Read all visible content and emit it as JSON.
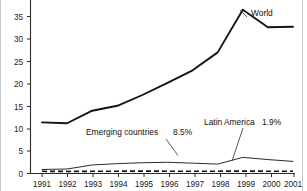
{
  "chart_data": {
    "type": "line",
    "title": "",
    "xlabel": "",
    "ylabel": "",
    "categories": [
      "1991",
      "1992",
      "1993",
      "1994",
      "1995",
      "1996",
      "1997",
      "1998",
      "1999",
      "2000",
      "2001"
    ],
    "ylim": [
      0,
      37.5
    ],
    "yticks": [
      0,
      5,
      10,
      15,
      20,
      25,
      30,
      35
    ],
    "ytick_labels": [
      "0",
      "5",
      "10",
      "15",
      "20",
      "25",
      "30",
      "35"
    ],
    "grid": false,
    "legend": "inline-annotations",
    "note": "Top of plot area is cropped by the image edge above the 35 tick.",
    "series": [
      {
        "name": "World",
        "style": "solid-thick",
        "values": [
          11.4,
          11.2,
          14.0,
          15.1,
          17.5,
          20.2,
          23.0,
          27.0,
          36.5,
          32.6,
          32.7
        ]
      },
      {
        "name": "Emerging countries",
        "style": "solid-thin",
        "values": [
          0.9,
          1.0,
          1.9,
          2.2,
          2.4,
          2.5,
          2.3,
          2.1,
          3.6,
          3.1,
          2.7
        ]
      },
      {
        "name": "Latin America",
        "style": "dashed",
        "values": [
          0.5,
          0.45,
          0.5,
          0.5,
          0.55,
          0.5,
          0.5,
          0.5,
          0.55,
          0.5,
          0.5
        ]
      }
    ],
    "annotations": [
      {
        "id": "world-label",
        "text": "World",
        "series": "World",
        "x": 251,
        "y": 14
      },
      {
        "id": "emerging-label",
        "text": "Emerging countries",
        "series": "Emerging countries",
        "value_text": "8.5%",
        "x": 86,
        "y": 132
      },
      {
        "id": "latam-label",
        "text": "Latin America",
        "series": "Latin America",
        "value_text": "1.9%",
        "x": 204,
        "y": 122
      }
    ]
  },
  "annotation_values": {
    "emerging": "8.5%",
    "latam": "1.9%"
  }
}
